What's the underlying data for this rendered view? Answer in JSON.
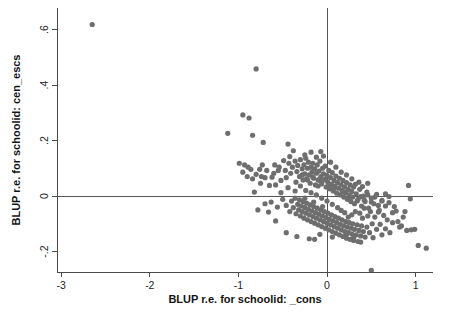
{
  "chart_data": {
    "type": "scatter",
    "title": "",
    "xlabel": "BLUP r.e. for schoolid: _cons",
    "ylabel": "BLUP r.e. for schoolid: cen_escs",
    "xlim": [
      -3.0,
      1.2
    ],
    "ylim": [
      -0.28,
      0.66
    ],
    "xticks": [
      -3,
      -2,
      -1,
      0,
      1
    ],
    "xticklabels": [
      "-3",
      "-2",
      "-1",
      "0",
      "1"
    ],
    "yticks": [
      0.6,
      0.4,
      0.2,
      0,
      -0.2
    ],
    "yticklabels": [
      ".6",
      ".4",
      ".2",
      "0",
      "-.2"
    ],
    "grid": false,
    "legend": null,
    "reference_lines": [
      {
        "orientation": "vertical",
        "value": 0
      },
      {
        "orientation": "horizontal",
        "value": 0
      }
    ],
    "marker": {
      "shape": "circle",
      "color": "#6e6e6e",
      "size_px": 5.2
    },
    "n_points": 302,
    "correlation_note": "negative association between the two random effects",
    "points": [
      [
        -2.65,
        0.618
      ],
      [
        -0.8,
        0.458
      ],
      [
        -0.95,
        0.292
      ],
      [
        -0.88,
        0.281
      ],
      [
        -1.12,
        0.226
      ],
      [
        -0.84,
        0.219
      ],
      [
        -0.72,
        0.193
      ],
      [
        -0.44,
        0.187
      ],
      [
        -0.38,
        0.163
      ],
      [
        -0.18,
        0.158
      ],
      [
        -0.07,
        0.16
      ],
      [
        -0.99,
        0.118
      ],
      [
        -0.93,
        0.112
      ],
      [
        -0.89,
        0.104
      ],
      [
        -0.86,
        0.096
      ],
      [
        -0.95,
        0.086
      ],
      [
        -0.8,
        0.078
      ],
      [
        -0.76,
        0.096
      ],
      [
        -0.7,
        0.066
      ],
      [
        -0.59,
        0.112
      ],
      [
        -0.54,
        0.104
      ],
      [
        -0.49,
        0.128
      ],
      [
        -0.47,
        0.092
      ],
      [
        -0.43,
        0.118
      ],
      [
        -0.41,
        0.082
      ],
      [
        -0.39,
        0.104
      ],
      [
        -0.36,
        0.126
      ],
      [
        -0.34,
        0.088
      ],
      [
        -0.33,
        0.11
      ],
      [
        -0.31,
        0.07
      ],
      [
        -0.3,
        0.131
      ],
      [
        -0.28,
        0.098
      ],
      [
        -0.27,
        0.058
      ],
      [
        -0.26,
        0.112
      ],
      [
        -0.25,
        0.08
      ],
      [
        -0.24,
        0.136
      ],
      [
        -0.23,
        0.062
      ],
      [
        -0.22,
        0.1
      ],
      [
        -0.21,
        0.122
      ],
      [
        -0.2,
        0.076
      ],
      [
        -0.19,
        0.046
      ],
      [
        -0.18,
        0.104
      ],
      [
        -0.17,
        0.086
      ],
      [
        -0.16,
        0.118
      ],
      [
        -0.15,
        0.064
      ],
      [
        -0.14,
        0.098
      ],
      [
        -0.13,
        0.04
      ],
      [
        -0.12,
        0.082
      ],
      [
        -0.11,
        0.112
      ],
      [
        -0.1,
        0.058
      ],
      [
        -0.09,
        0.09
      ],
      [
        -0.08,
        0.126
      ],
      [
        -0.07,
        0.07
      ],
      [
        -0.06,
        0.044
      ],
      [
        -0.05,
        0.1
      ],
      [
        -0.04,
        0.08
      ],
      [
        -0.03,
        0.058
      ],
      [
        -0.02,
        0.108
      ],
      [
        -0.01,
        0.032
      ],
      [
        0.0,
        0.074
      ],
      [
        0.01,
        0.05
      ],
      [
        0.02,
        0.092
      ],
      [
        0.03,
        0.026
      ],
      [
        0.04,
        0.066
      ],
      [
        0.05,
        0.042
      ],
      [
        0.06,
        0.084
      ],
      [
        0.07,
        0.018
      ],
      [
        0.08,
        0.056
      ],
      [
        0.09,
        0.036
      ],
      [
        0.1,
        0.072
      ],
      [
        0.11,
        0.01
      ],
      [
        0.12,
        0.048
      ],
      [
        0.13,
        0.028
      ],
      [
        0.14,
        0.064
      ],
      [
        0.15,
        0.004
      ],
      [
        0.16,
        0.04
      ],
      [
        0.17,
        0.02
      ],
      [
        0.18,
        0.056
      ],
      [
        0.19,
        -0.004
      ],
      [
        0.2,
        0.032
      ],
      [
        0.21,
        0.012
      ],
      [
        0.22,
        0.048
      ],
      [
        0.23,
        -0.012
      ],
      [
        0.24,
        0.024
      ],
      [
        0.25,
        0.004
      ],
      [
        0.26,
        0.04
      ],
      [
        0.27,
        -0.02
      ],
      [
        0.28,
        0.016
      ],
      [
        0.29,
        -0.004
      ],
      [
        0.3,
        0.032
      ],
      [
        0.31,
        -0.028
      ],
      [
        0.33,
        0.008
      ],
      [
        0.35,
        -0.012
      ],
      [
        0.37,
        0.024
      ],
      [
        0.39,
        -0.036
      ],
      [
        0.41,
        0.0
      ],
      [
        0.43,
        -0.02
      ],
      [
        0.45,
        0.014
      ],
      [
        0.47,
        -0.044
      ],
      [
        0.5,
        -0.008
      ],
      [
        0.53,
        -0.028
      ],
      [
        0.56,
        0.006
      ],
      [
        0.59,
        -0.052
      ],
      [
        0.62,
        -0.016
      ],
      [
        0.66,
        -0.036
      ],
      [
        0.7,
        -0.002
      ],
      [
        0.74,
        -0.06
      ],
      [
        -0.82,
        0.014
      ],
      [
        -0.78,
        -0.05
      ],
      [
        -0.63,
        -0.022
      ],
      [
        -0.56,
        -0.04
      ],
      [
        -0.5,
        -0.012
      ],
      [
        -0.46,
        -0.034
      ],
      [
        -0.42,
        -0.056
      ],
      [
        -0.4,
        -0.018
      ],
      [
        -0.38,
        -0.042
      ],
      [
        -0.36,
        -0.008
      ],
      [
        -0.35,
        -0.064
      ],
      [
        -0.33,
        -0.03
      ],
      [
        -0.32,
        -0.05
      ],
      [
        -0.31,
        -0.014
      ],
      [
        -0.3,
        -0.072
      ],
      [
        -0.29,
        -0.036
      ],
      [
        -0.28,
        -0.056
      ],
      [
        -0.27,
        -0.02
      ],
      [
        -0.26,
        -0.08
      ],
      [
        -0.25,
        -0.042
      ],
      [
        -0.24,
        -0.062
      ],
      [
        -0.23,
        -0.026
      ],
      [
        -0.22,
        -0.086
      ],
      [
        -0.21,
        -0.048
      ],
      [
        -0.2,
        -0.068
      ],
      [
        -0.19,
        -0.032
      ],
      [
        -0.18,
        -0.092
      ],
      [
        -0.17,
        -0.054
      ],
      [
        -0.16,
        -0.074
      ],
      [
        -0.15,
        -0.038
      ],
      [
        -0.14,
        -0.098
      ],
      [
        -0.13,
        -0.06
      ],
      [
        -0.12,
        -0.08
      ],
      [
        -0.11,
        -0.044
      ],
      [
        -0.1,
        -0.104
      ],
      [
        -0.09,
        -0.066
      ],
      [
        -0.08,
        -0.086
      ],
      [
        -0.07,
        -0.05
      ],
      [
        -0.06,
        -0.11
      ],
      [
        -0.05,
        -0.072
      ],
      [
        -0.04,
        -0.092
      ],
      [
        -0.03,
        -0.056
      ],
      [
        -0.02,
        -0.116
      ],
      [
        -0.01,
        -0.078
      ],
      [
        0.0,
        -0.098
      ],
      [
        0.01,
        -0.062
      ],
      [
        0.02,
        -0.122
      ],
      [
        0.03,
        -0.084
      ],
      [
        0.04,
        -0.104
      ],
      [
        0.05,
        -0.068
      ],
      [
        0.06,
        -0.128
      ],
      [
        0.07,
        -0.09
      ],
      [
        0.08,
        -0.11
      ],
      [
        0.09,
        -0.074
      ],
      [
        0.1,
        -0.134
      ],
      [
        0.11,
        -0.096
      ],
      [
        0.12,
        -0.116
      ],
      [
        0.13,
        -0.08
      ],
      [
        0.14,
        -0.14
      ],
      [
        0.15,
        -0.102
      ],
      [
        0.16,
        -0.122
      ],
      [
        0.17,
        -0.086
      ],
      [
        0.18,
        -0.146
      ],
      [
        0.19,
        -0.108
      ],
      [
        0.2,
        -0.128
      ],
      [
        0.21,
        -0.092
      ],
      [
        0.22,
        -0.152
      ],
      [
        0.23,
        -0.112
      ],
      [
        0.24,
        -0.132
      ],
      [
        0.25,
        -0.096
      ],
      [
        0.26,
        -0.156
      ],
      [
        0.27,
        -0.116
      ],
      [
        0.28,
        -0.136
      ],
      [
        0.29,
        -0.1
      ],
      [
        0.3,
        -0.16
      ],
      [
        0.31,
        -0.12
      ],
      [
        0.32,
        -0.056
      ],
      [
        0.33,
        -0.14
      ],
      [
        0.34,
        -0.104
      ],
      [
        0.35,
        -0.164
      ],
      [
        0.36,
        -0.124
      ],
      [
        0.37,
        -0.062
      ],
      [
        0.38,
        -0.144
      ],
      [
        0.39,
        -0.108
      ],
      [
        0.4,
        -0.08
      ],
      [
        0.41,
        -0.128
      ],
      [
        0.42,
        -0.044
      ],
      [
        0.43,
        -0.148
      ],
      [
        0.45,
        -0.112
      ],
      [
        0.46,
        -0.072
      ],
      [
        0.48,
        -0.132
      ],
      [
        0.49,
        -0.056
      ],
      [
        0.51,
        -0.1
      ],
      [
        0.52,
        -0.15
      ],
      [
        0.54,
        -0.076
      ],
      [
        0.56,
        -0.12
      ],
      [
        0.58,
        -0.058
      ],
      [
        0.6,
        -0.102
      ],
      [
        0.62,
        -0.14
      ],
      [
        0.64,
        -0.07
      ],
      [
        0.66,
        -0.118
      ],
      [
        0.68,
        -0.086
      ],
      [
        0.71,
        -0.132
      ],
      [
        0.74,
        -0.096
      ],
      [
        0.78,
        -0.054
      ],
      [
        0.82,
        -0.112
      ],
      [
        0.86,
        -0.076
      ],
      [
        0.9,
        -0.124
      ],
      [
        0.92,
        0.038
      ],
      [
        0.94,
        -0.01
      ],
      [
        0.88,
        -0.056
      ],
      [
        0.95,
        -0.122
      ],
      [
        0.99,
        -0.12
      ],
      [
        1.03,
        -0.178
      ],
      [
        1.12,
        -0.188
      ],
      [
        0.5,
        -0.268
      ],
      [
        -0.46,
        -0.132
      ],
      [
        -0.34,
        -0.146
      ],
      [
        -0.2,
        -0.154
      ],
      [
        -0.14,
        -0.156
      ],
      [
        -0.58,
        -0.09
      ],
      [
        -0.66,
        -0.058
      ],
      [
        -0.7,
        -0.028
      ],
      [
        -0.73,
        0.112
      ],
      [
        -0.6,
        0.082
      ],
      [
        -0.52,
        0.056
      ],
      [
        -0.46,
        0.066
      ],
      [
        -0.42,
        0.142
      ],
      [
        -0.25,
        0.148
      ],
      [
        -0.12,
        0.14
      ],
      [
        -0.04,
        0.144
      ],
      [
        0.04,
        0.122
      ],
      [
        0.1,
        0.104
      ],
      [
        0.16,
        0.086
      ],
      [
        0.22,
        0.076
      ],
      [
        0.28,
        0.062
      ],
      [
        -0.3,
        0.036
      ],
      [
        -0.24,
        0.02
      ],
      [
        -0.18,
        0.012
      ],
      [
        -0.12,
        0.004
      ],
      [
        -0.06,
        -0.008
      ],
      [
        0.0,
        -0.018
      ],
      [
        0.06,
        -0.03
      ],
      [
        0.12,
        -0.042
      ],
      [
        -0.36,
        0.018
      ],
      [
        -0.44,
        0.03
      ],
      [
        -0.52,
        0.012
      ],
      [
        -0.58,
        0.04
      ],
      [
        -0.62,
        0.068
      ],
      [
        -0.68,
        0.092
      ],
      [
        -0.74,
        0.07
      ],
      [
        -0.84,
        0.062
      ],
      [
        0.34,
        -0.018
      ],
      [
        0.38,
        -0.002
      ],
      [
        0.42,
        -0.014
      ],
      [
        0.46,
        0.004
      ],
      [
        0.5,
        -0.022
      ],
      [
        0.54,
        -0.004
      ],
      [
        0.58,
        -0.034
      ],
      [
        0.62,
        -0.018
      ],
      [
        0.66,
        0.008
      ],
      [
        0.7,
        -0.024
      ],
      [
        0.46,
        0.046
      ],
      [
        0.4,
        0.034
      ],
      [
        0.36,
        0.05
      ],
      [
        0.32,
        0.042
      ],
      [
        0.28,
        -0.068
      ],
      [
        0.24,
        -0.076
      ],
      [
        0.2,
        -0.06
      ],
      [
        0.16,
        -0.052
      ],
      [
        -0.02,
        0.06
      ],
      [
        -0.08,
        0.056
      ],
      [
        0.02,
        0.038
      ],
      [
        0.08,
        0.028
      ],
      [
        -0.16,
        0.068
      ],
      [
        -0.22,
        0.058
      ],
      [
        -0.28,
        0.076
      ],
      [
        -0.1,
        0.036
      ],
      [
        0.18,
        0.014
      ],
      [
        0.26,
        -0.004
      ],
      [
        -0.05,
        -0.038
      ],
      [
        -0.15,
        -0.022
      ],
      [
        -0.25,
        -0.008
      ],
      [
        -0.35,
        0.05
      ],
      [
        -0.55,
        0.092
      ],
      [
        -0.65,
        0.038
      ],
      [
        -0.75,
        0.046
      ],
      [
        -0.9,
        0.07
      ],
      [
        0.76,
        -0.038
      ],
      [
        0.8,
        -0.092
      ],
      [
        0.84,
        -0.108
      ],
      [
        0.38,
        -0.166
      ],
      [
        0.3,
        -0.15
      ],
      [
        0.22,
        -0.138
      ],
      [
        0.06,
        -0.148
      ],
      [
        -0.08,
        -0.138
      ]
    ]
  },
  "figure": {
    "background": "#ffffff",
    "frame_color": "#4a4a4a"
  }
}
